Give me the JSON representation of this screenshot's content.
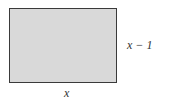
{
  "diagram": {
    "shape": "rectangle",
    "fill_color": "#d9d9d9",
    "border_color": "#3a3a3a",
    "labels": {
      "height": "x − 1",
      "width": "x"
    }
  }
}
